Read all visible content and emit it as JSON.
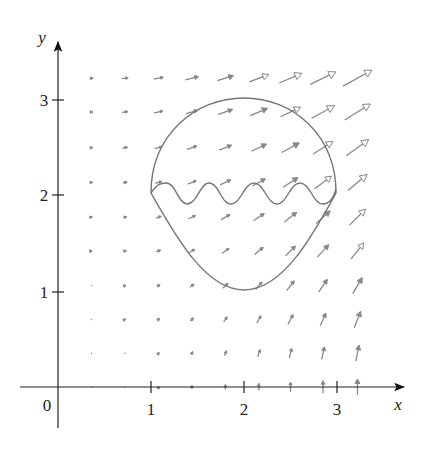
{
  "chart_data": {
    "type": "vector_field",
    "title": "",
    "xlabel": "x",
    "ylabel": "y",
    "origin_label": "0",
    "x_ticks": [
      1,
      2,
      3
    ],
    "y_ticks": [
      1,
      2,
      3
    ],
    "x_tick_labels": [
      "1",
      "2",
      "3"
    ],
    "y_tick_labels": [
      "1",
      "2",
      "3"
    ],
    "xlim": [
      -0.4,
      3.7
    ],
    "ylim": [
      -0.45,
      3.6
    ],
    "grid": false,
    "field": {
      "description": "Vector field arrows on a 9x10 grid; arrows grow longer and turn from horizontal (top-left) to vertical (near x-axis) as x increases",
      "grid_x": [
        0.36,
        0.72,
        1.08,
        1.44,
        1.8,
        2.16,
        2.5,
        2.85,
        3.22
      ],
      "grid_y": [
        3.2,
        2.85,
        2.48,
        2.12,
        1.76,
        1.41,
        1.05,
        0.7,
        0.35,
        0.0
      ],
      "approx_formula": "F(x,y) ≈ (x·y, 0.55·x²)",
      "color": "#888888"
    },
    "curve": {
      "description": "Closed curve: upper circular arc from (1,2) over top (2,3) to (3,2); lower teardrop arc down to (2,1); a wavy curve with 4 crests runs across at y≈2",
      "top": [
        2,
        3
      ],
      "bottom": [
        2,
        1
      ],
      "left": [
        1,
        2
      ],
      "right": [
        3,
        2
      ],
      "wave_crests": 4,
      "color": "#777777"
    }
  }
}
